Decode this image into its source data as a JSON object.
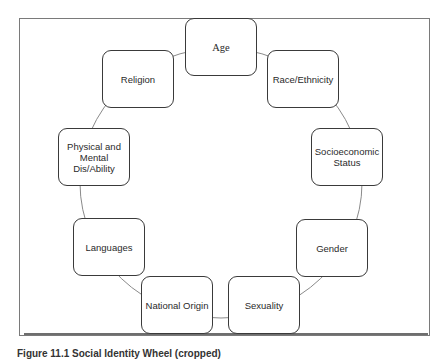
{
  "diagram": {
    "type": "cycle",
    "nodes": [
      {
        "id": "age",
        "label": "Age"
      },
      {
        "id": "race",
        "label": "Race/Ethnicity"
      },
      {
        "id": "ses",
        "label": "Socioeconomic Status"
      },
      {
        "id": "gender",
        "label": "Gender"
      },
      {
        "id": "sexuality",
        "label": "Sexuality"
      },
      {
        "id": "national-origin",
        "label": "National Origin"
      },
      {
        "id": "languages",
        "label": "Languages"
      },
      {
        "id": "disability",
        "label": "Physical and Mental Dis/Ability"
      },
      {
        "id": "religion",
        "label": "Religion"
      }
    ],
    "connector": "circle",
    "caption": "Figure 11.1 Social Identity Wheel (cropped)"
  },
  "colors": {
    "frame": "#7a7a7a",
    "node_border": "#3a3a3a",
    "connector": "#8a8a8a",
    "text": "#2a2a2a"
  }
}
